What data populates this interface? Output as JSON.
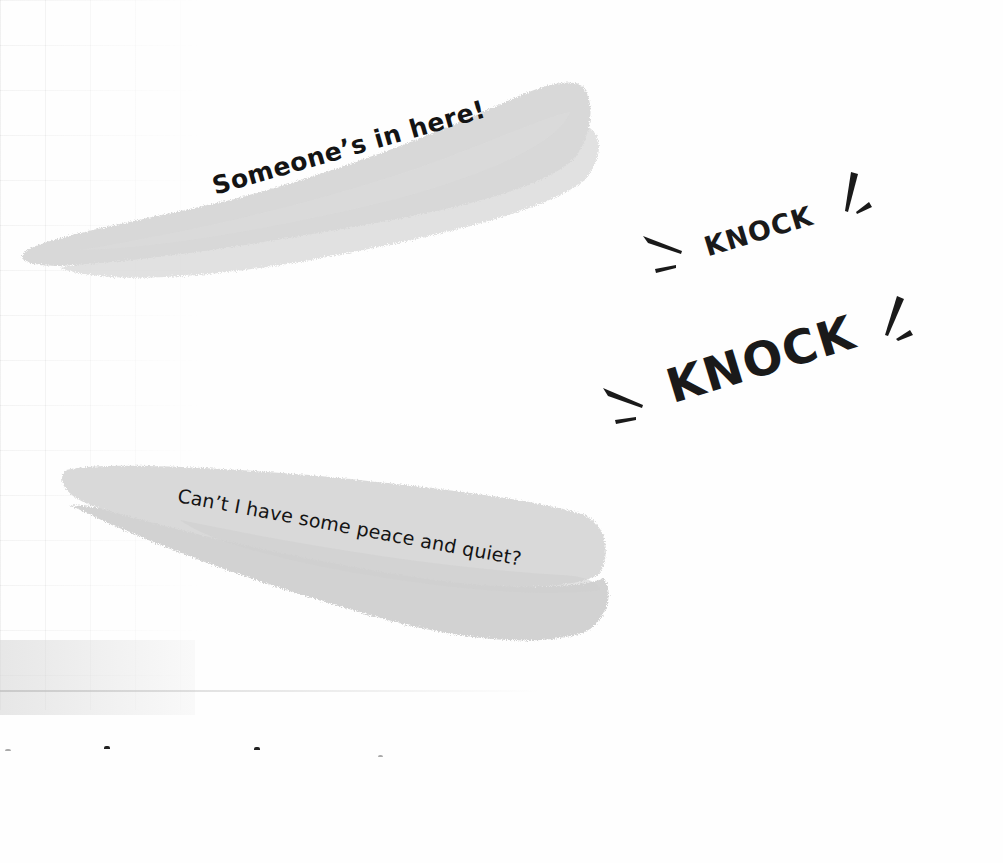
{
  "page": {
    "background_color": "#fefefe",
    "ink_color": "#1a1a1a",
    "brush_color": "#d9d9d9",
    "brush_shadow_color": "#cfcfcf"
  },
  "speech_bubbles": [
    {
      "id": "bubble-1",
      "text": "Someone’s in here!",
      "style": "bold",
      "shape": "brush-stroke"
    },
    {
      "id": "bubble-2",
      "text": "Can’t I have some peace and quiet?",
      "style": "regular",
      "shape": "brush-stroke"
    }
  ],
  "sound_effects": [
    {
      "id": "knock-1",
      "text": "KNOCK",
      "size": "small",
      "icon": "burst-lines-icon"
    },
    {
      "id": "knock-2",
      "text": "KNOCK",
      "size": "large",
      "icon": "burst-lines-icon"
    }
  ]
}
